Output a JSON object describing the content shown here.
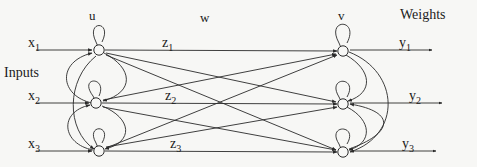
{
  "figure": {
    "type": "neural-network-diagram",
    "title": "",
    "background_color": "#f7f7f5",
    "stroke_color": "#2a2a2a"
  },
  "headers": {
    "u": "u",
    "w": "w",
    "v": "v",
    "weights": "Weights",
    "inputs": "Inputs"
  },
  "inputs": [
    {
      "base": "x",
      "sub": "1"
    },
    {
      "base": "x",
      "sub": "2"
    },
    {
      "base": "x",
      "sub": "3"
    }
  ],
  "hidden_signals": [
    {
      "base": "z",
      "sub": "1"
    },
    {
      "base": "z",
      "sub": "2"
    },
    {
      "base": "z",
      "sub": "3"
    }
  ],
  "outputs": [
    {
      "base": "y",
      "sub": "1"
    },
    {
      "base": "y",
      "sub": "2"
    },
    {
      "base": "y",
      "sub": "3"
    }
  ],
  "layers": {
    "left": {
      "label": "u",
      "node_count": 3
    },
    "right": {
      "label": "v",
      "node_count": 3
    }
  }
}
